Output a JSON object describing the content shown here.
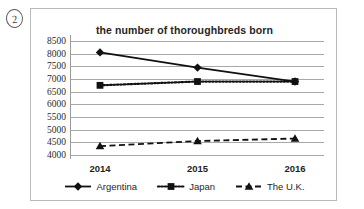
{
  "annotation": {
    "number_label": "2",
    "icon": "circled-number-icon"
  },
  "chart_data": {
    "type": "line",
    "title": "the number of thoroughbreds born",
    "xlabel": "",
    "ylabel": "",
    "categories": [
      "2014",
      "2015",
      "2016"
    ],
    "yticks": [
      4000,
      4500,
      5000,
      5500,
      6000,
      6500,
      7000,
      7500,
      8000,
      8500
    ],
    "ytick_labels": [
      "4000",
      "4500",
      "5000",
      "5500",
      "6000",
      "6500",
      "7000",
      "7500",
      "8000",
      "8500"
    ],
    "ylim": [
      4000,
      8500
    ],
    "grid": true,
    "legend_position": "bottom",
    "series": [
      {
        "name": "Argentina",
        "values": [
          8050,
          7450,
          6900
        ],
        "marker": "diamond",
        "linestyle": "solid",
        "color": "#111111"
      },
      {
        "name": "Japan",
        "values": [
          6750,
          6900,
          6900
        ],
        "marker": "square",
        "linestyle": "dotted",
        "color": "#111111"
      },
      {
        "name": "The U.K.",
        "values": [
          4350,
          4550,
          4650
        ],
        "marker": "triangle",
        "linestyle": "dashed",
        "color": "#111111"
      }
    ]
  },
  "colors": {
    "frame": "#b9b9b9",
    "gridline": "#a8a8a8",
    "axis": "#9a9a9a",
    "text": "#1f1f1f",
    "background": "#ffffff"
  }
}
